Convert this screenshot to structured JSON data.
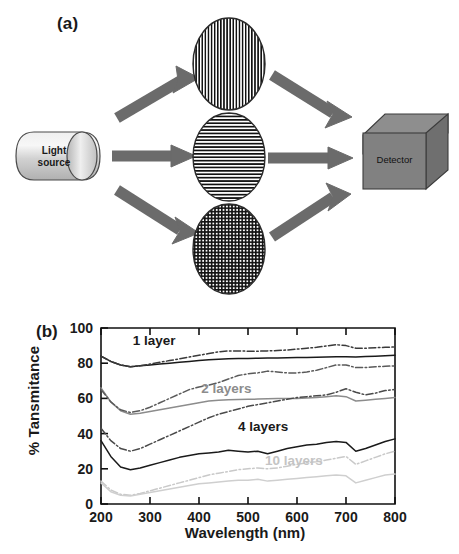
{
  "figure": {
    "panel_a": {
      "label": "(a)",
      "light_source": {
        "line1": "Light",
        "line2": "source"
      },
      "detector": "Detector",
      "samples": [
        {
          "name": "vertical-grating-sample",
          "pattern": "vertical-stripes"
        },
        {
          "name": "horizontal-grating-sample",
          "pattern": "horizontal-stripes"
        },
        {
          "name": "crosshatch-grating-sample",
          "pattern": "crosshatch-grid"
        }
      ],
      "arrow_color": "#6b6b6b",
      "detector_color": "#7a7a7a",
      "source_color": "#c9c9c9"
    },
    "panel_b": {
      "label": "(b)"
    }
  },
  "chart_data": {
    "type": "line",
    "title": "",
    "xlabel": "Wavelength (nm)",
    "ylabel": "% Tansmitance",
    "xlim": [
      200,
      800
    ],
    "ylim": [
      0,
      100
    ],
    "xticks": [
      200,
      300,
      400,
      500,
      600,
      700,
      800
    ],
    "yticks": [
      0,
      20,
      40,
      60,
      80,
      100
    ],
    "grid": false,
    "legend_position": "inline-annotations",
    "annotations": [
      {
        "text": "1 layer",
        "x": 330,
        "y": 92,
        "color": "#1a1a1a"
      },
      {
        "text": "2 layers",
        "x": 470,
        "y": 65,
        "color": "#8c8c8c"
      },
      {
        "text": "4 layers",
        "x": 545,
        "y": 43,
        "color": "#1a1a1a"
      },
      {
        "text": "10 layers",
        "x": 600,
        "y": 24,
        "color": "#c4c4c4"
      }
    ],
    "x": [
      200,
      220,
      240,
      260,
      280,
      300,
      320,
      340,
      360,
      380,
      400,
      420,
      440,
      460,
      480,
      500,
      520,
      540,
      560,
      580,
      600,
      620,
      640,
      660,
      680,
      700,
      720,
      740,
      760,
      780,
      800
    ],
    "series": [
      {
        "name": "1 layer (solid)",
        "color": "#1a1a1a",
        "style": "solid",
        "values": [
          84,
          81,
          79,
          78,
          78.5,
          79,
          79.5,
          80,
          80.5,
          81,
          81.5,
          82,
          82.3,
          82.5,
          82.6,
          82.7,
          82.8,
          82.9,
          83,
          83.1,
          83.2,
          83.3,
          83.4,
          83.5,
          83.6,
          83.7,
          83.5,
          83.8,
          84,
          84.2,
          84.5
        ]
      },
      {
        "name": "1 layer (dash-dot)",
        "color": "#3a3a3a",
        "style": "dashdot",
        "values": [
          84,
          81,
          79,
          78,
          78.5,
          79.5,
          80.5,
          81.5,
          82.5,
          83.5,
          84.5,
          85.5,
          86.5,
          87,
          87,
          86.8,
          86.8,
          87,
          87.2,
          87.5,
          88,
          88.5,
          89,
          89.8,
          90.5,
          90,
          88.5,
          88.5,
          88.8,
          89,
          89.2
        ]
      },
      {
        "name": "2 layers (solid)",
        "color": "#8c8c8c",
        "style": "solid",
        "values": [
          66,
          58,
          53,
          51,
          51.5,
          52.5,
          53.5,
          54.5,
          55.5,
          56.5,
          57.5,
          58.5,
          59,
          59.3,
          59.4,
          59.5,
          59.6,
          59.8,
          60,
          60,
          60,
          60.2,
          60.5,
          61,
          61.5,
          61,
          58.5,
          59,
          59.5,
          60,
          60.5
        ]
      },
      {
        "name": "2 layers (dash-dot)",
        "color": "#5a5a5a",
        "style": "dashdot",
        "values": [
          65,
          58,
          53.5,
          52,
          53,
          55,
          57.5,
          60,
          62.5,
          65,
          66.5,
          67.5,
          69,
          71,
          73,
          74,
          74.5,
          75.5,
          75,
          74.5,
          74.5,
          75,
          76,
          77.5,
          79,
          79,
          77.5,
          77.5,
          78,
          78.2,
          78.5
        ]
      },
      {
        "name": "4 layers (dash-dot upper)",
        "color": "#4a4a4a",
        "style": "dashdot",
        "values": [
          43,
          36,
          31.5,
          30,
          31.5,
          34,
          36.5,
          39,
          41.5,
          44,
          46.5,
          49,
          51,
          52.5,
          54,
          55.5,
          56.5,
          57.5,
          58.5,
          59.5,
          60.5,
          61,
          61.5,
          62,
          63.5,
          65.5,
          63.5,
          62,
          63,
          64.5,
          65
        ]
      },
      {
        "name": "4 layers (solid)",
        "color": "#1a1a1a",
        "style": "solid",
        "values": [
          36,
          27,
          21,
          19.5,
          20.5,
          22,
          23.5,
          25,
          26.5,
          27.5,
          28.5,
          29,
          29.5,
          30.5,
          30,
          29.5,
          30,
          28.5,
          30,
          31.5,
          32.5,
          33.5,
          34,
          35,
          35.5,
          35,
          30,
          31.5,
          33.5,
          35.5,
          37
        ]
      },
      {
        "name": "10 layers (dash-dot)",
        "color": "#c9c9c9",
        "style": "dashdot",
        "values": [
          13,
          8,
          5.5,
          5,
          6,
          7.5,
          9,
          10.5,
          12,
          13.5,
          15,
          16.5,
          17.5,
          18.5,
          19.5,
          20,
          20.5,
          20,
          20.5,
          21.5,
          22.5,
          23.5,
          24,
          25,
          26,
          27,
          22.5,
          24.5,
          26.5,
          28.5,
          30
        ]
      },
      {
        "name": "10 layers (solid)",
        "color": "#cfcfcf",
        "style": "solid",
        "values": [
          12,
          7,
          5,
          4.5,
          5.5,
          6.5,
          7.5,
          8.5,
          9.5,
          10.5,
          11.5,
          12,
          12.5,
          13,
          13.5,
          13.5,
          14,
          13,
          13.5,
          14,
          14.5,
          15,
          15.5,
          16,
          16.5,
          16,
          12,
          13.5,
          15,
          16.5,
          17
        ]
      }
    ]
  }
}
